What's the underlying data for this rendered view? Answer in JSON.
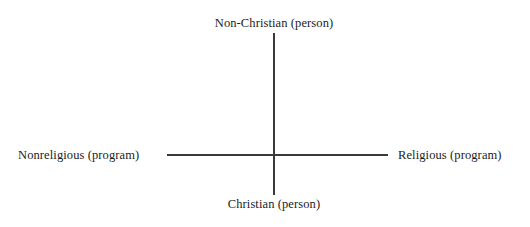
{
  "diagram": {
    "type": "two-axis-quadrant",
    "axes": {
      "vertical": {
        "name": "person-axis",
        "top_label": "Non-Christian (person)",
        "bottom_label": "Christian (person)"
      },
      "horizontal": {
        "name": "program-axis",
        "left_label": "Nonreligious (program)",
        "right_label": "Religious (program)"
      }
    },
    "colors": {
      "background": "#ffffff",
      "axis_line": "#3a3a3a",
      "label_text": "#1c1c1c"
    }
  }
}
